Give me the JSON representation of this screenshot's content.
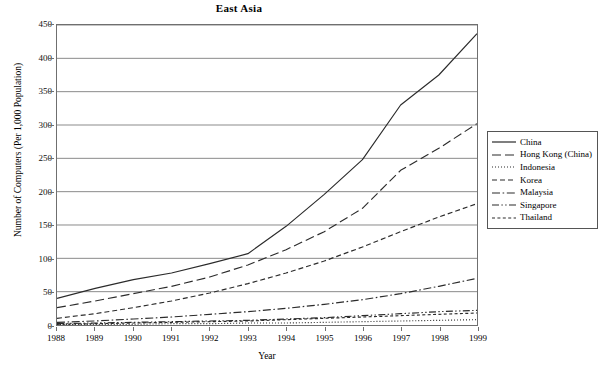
{
  "chart_data": {
    "type": "line",
    "title": "East Asia",
    "xlabel": "Year",
    "ylabel": "Number of Computers (Per 1,000 Population)",
    "x": [
      1988,
      1989,
      1990,
      1991,
      1992,
      1993,
      1994,
      1995,
      1996,
      1997,
      1998,
      1999
    ],
    "xticklabels": [
      "1988",
      "1989",
      "1990",
      "1991",
      "1992",
      "1993",
      "1994",
      "1995",
      "1996",
      "1997",
      "1998",
      "1999"
    ],
    "yticklabels": [
      "0",
      "50",
      "100",
      "150",
      "200",
      "250",
      "300",
      "350",
      "400",
      "450"
    ],
    "ylim": [
      0,
      450
    ],
    "ytick_step": 50,
    "grid": "horizontal",
    "legend_position": "right-outside",
    "series": [
      {
        "name": "China",
        "dash": "solid",
        "values": [
          40,
          55,
          68,
          78,
          92,
          107,
          148,
          196,
          248,
          330,
          375,
          437
        ]
      },
      {
        "name": "Hong Kong (China)",
        "dash": "long-dash",
        "values": [
          26,
          36,
          47,
          58,
          72,
          90,
          113,
          140,
          175,
          232,
          265,
          302
        ]
      },
      {
        "name": "Korea",
        "dash": "medium-dash",
        "values": [
          10,
          17,
          26,
          36,
          48,
          62,
          78,
          96,
          117,
          140,
          162,
          182
        ]
      },
      {
        "name": "Malaysia",
        "dash": "dash-dot",
        "values": [
          4,
          6,
          9,
          12,
          16,
          20,
          25,
          31,
          38,
          47,
          58,
          70
        ]
      },
      {
        "name": "Singapore",
        "dash": "dash-dot-dot",
        "values": [
          2,
          3,
          4,
          5,
          6,
          7,
          9,
          11,
          14,
          17,
          20,
          22
        ]
      },
      {
        "name": "Thailand",
        "dash": "short-dash",
        "values": [
          1,
          2,
          3,
          4,
          5,
          6,
          8,
          10,
          12,
          14,
          16,
          18
        ]
      },
      {
        "name": "Indonesia",
        "dash": "dotted",
        "values": [
          1,
          1,
          1,
          2,
          2,
          3,
          3,
          4,
          5,
          6,
          7,
          8
        ]
      }
    ],
    "legend_order": [
      "China",
      "Hong Kong (China)",
      "Indonesia",
      "Korea",
      "Malaysia",
      "Singapore",
      "Thailand"
    ],
    "colors": {
      "line": "#2b2b2b",
      "grid": "#8a8a8a",
      "axis": "#6f6f6f",
      "background": "#ffffff"
    }
  }
}
